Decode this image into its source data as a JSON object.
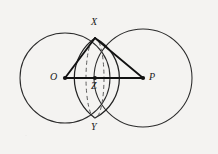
{
  "figure": {
    "kind": "geometry-diagram",
    "background_color": "#f4f3f1",
    "stroke_color": "#1a1a1a",
    "width": 218,
    "height": 154,
    "labels": {
      "O": "O",
      "P": "P",
      "X": "X",
      "Y": "Y",
      "Z": "Z"
    },
    "label_positions": {
      "O": {
        "x": 50,
        "y": 72
      },
      "P": {
        "x": 149,
        "y": 72
      },
      "X": {
        "x": 91,
        "y": 17
      },
      "Y": {
        "x": 91,
        "y": 122
      },
      "Z": {
        "x": 91,
        "y": 81
      }
    },
    "points": {
      "O": {
        "x": 65,
        "y": 78,
        "marker": "dot"
      },
      "P": {
        "x": 143,
        "y": 78,
        "marker": "dot"
      },
      "X": {
        "x": 95,
        "y": 38,
        "marker": "none"
      },
      "Y": {
        "x": 95,
        "y": 118,
        "marker": "none"
      },
      "Z": {
        "x": 95,
        "y": 78,
        "marker": "dot"
      }
    },
    "circles": [
      {
        "name": "circle-O",
        "cx": 65,
        "cy": 78,
        "r": 45,
        "style": "solid"
      },
      {
        "name": "circle-P",
        "cx": 143,
        "cy": 78,
        "r": 49,
        "style": "solid"
      }
    ],
    "ellipse": {
      "name": "dashed-ellipse",
      "cx": 95,
      "cy": 78,
      "rx": 9,
      "ry": 40,
      "style": "dashed"
    },
    "segments": [
      {
        "name": "segment-OX",
        "x1": 65,
        "y1": 78,
        "x2": 95,
        "y2": 38
      },
      {
        "name": "segment-XP",
        "x1": 95,
        "y1": 38,
        "x2": 143,
        "y2": 78
      },
      {
        "name": "segment-OP",
        "x1": 65,
        "y1": 78,
        "x2": 143,
        "y2": 78
      }
    ]
  }
}
